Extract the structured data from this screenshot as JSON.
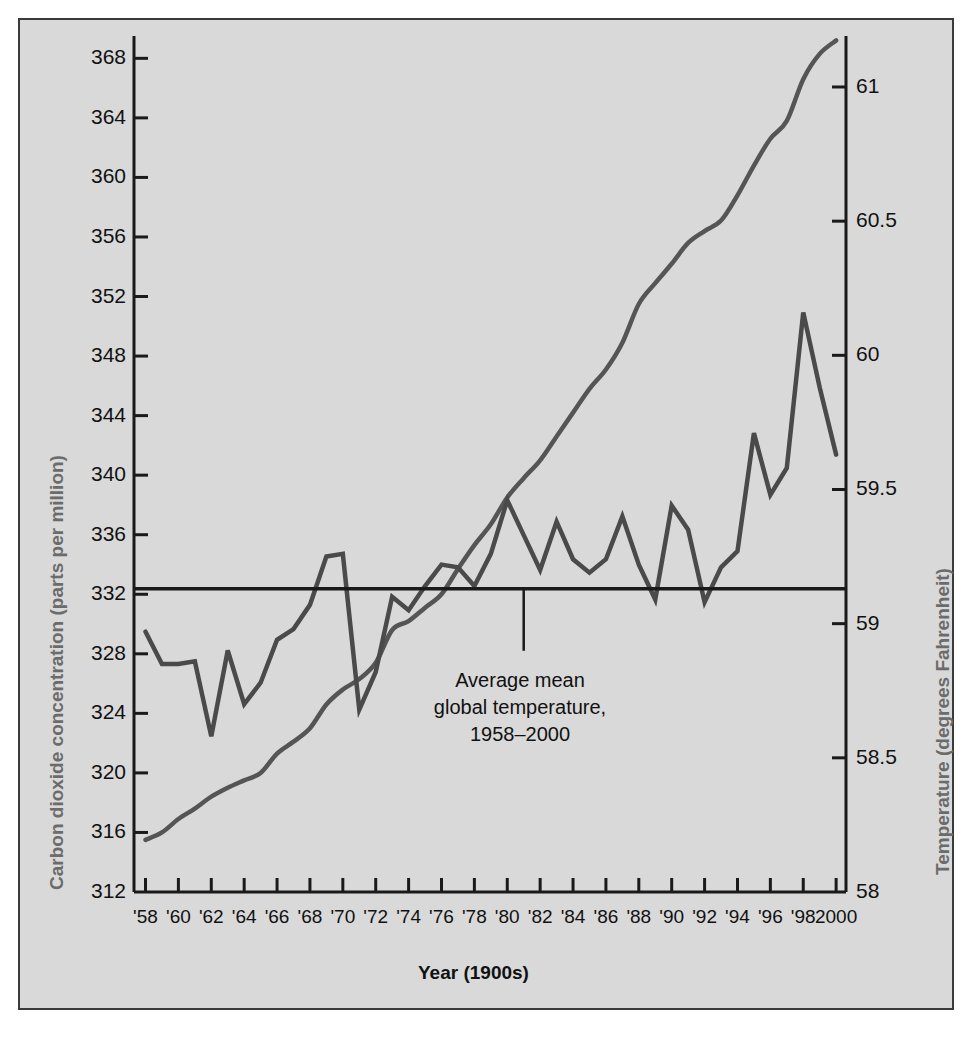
{
  "figure": {
    "background_color": "#d9d9d9",
    "border_color": "#3a3a3a",
    "line_color": "#4a4a4a",
    "axis_color": "#1a1a1a",
    "axis_title_color": "#6b6b6b"
  },
  "axes": {
    "left_title": "Carbon dioxide concentration (parts per million)",
    "right_title": "Temperature (degrees Fahrenheit)",
    "bottom_title": "Year (1900s)",
    "left_ticks": [
      "368",
      "364",
      "360",
      "356",
      "352",
      "348",
      "344",
      "340",
      "336",
      "332",
      "328",
      "324",
      "320",
      "316",
      "312"
    ],
    "right_ticks": [
      "61",
      "60.5",
      "60",
      "59.5",
      "59",
      "58.5",
      "58"
    ],
    "x_ticks": [
      "'58",
      "'60",
      "'62",
      "'64",
      "'66",
      "'68",
      "'70",
      "'72",
      "'74",
      "'76",
      "'78",
      "'80",
      "'82",
      "'84",
      "'86",
      "'88",
      "'90",
      "'92",
      "'94",
      "'96",
      "'98",
      "2000"
    ]
  },
  "annotation": {
    "line1": "Average mean",
    "line2": "global temperature,",
    "line3": "1958–2000",
    "leader_year": 1981,
    "leader_value": 59.13
  },
  "chart_data": {
    "type": "line",
    "title": "",
    "xlabel": "Year (1900s)",
    "ylabel": "Carbon dioxide concentration (parts per million)",
    "y2label": "Temperature (degrees Fahrenheit)",
    "xlim": [
      1957.3,
      2000.6
    ],
    "ylim": [
      312,
      369.5
    ],
    "y2lim": [
      58,
      61.19
    ],
    "grid": false,
    "legend": "none",
    "x": [
      1958,
      1959,
      1960,
      1961,
      1962,
      1963,
      1964,
      1965,
      1966,
      1967,
      1968,
      1969,
      1970,
      1971,
      1972,
      1973,
      1974,
      1975,
      1976,
      1977,
      1978,
      1979,
      1980,
      1981,
      1982,
      1983,
      1984,
      1985,
      1986,
      1987,
      1988,
      1989,
      1990,
      1991,
      1992,
      1993,
      1994,
      1995,
      1996,
      1997,
      1998,
      1999,
      2000
    ],
    "series": [
      {
        "name": "Carbon dioxide concentration",
        "axis": "left",
        "unit": "parts per million",
        "values": [
          315.5,
          316.0,
          316.9,
          317.6,
          318.4,
          319.0,
          319.5,
          320.0,
          321.3,
          322.1,
          323.0,
          324.6,
          325.6,
          326.3,
          327.4,
          329.6,
          330.2,
          331.1,
          332.0,
          333.7,
          335.3,
          336.7,
          338.5,
          339.8,
          341.0,
          342.6,
          344.2,
          345.8,
          347.1,
          348.9,
          351.5,
          352.9,
          354.2,
          355.6,
          356.4,
          357.1,
          358.8,
          360.8,
          362.6,
          363.8,
          366.6,
          368.3,
          369.2
        ]
      },
      {
        "name": "Average global temperature",
        "axis": "right",
        "unit": "degrees Fahrenheit",
        "values": [
          58.97,
          58.85,
          58.85,
          58.86,
          58.58,
          58.9,
          58.7,
          58.78,
          58.94,
          58.98,
          59.07,
          59.25,
          59.26,
          58.68,
          58.82,
          59.1,
          59.05,
          59.14,
          59.22,
          59.21,
          59.14,
          59.26,
          59.46,
          59.33,
          59.2,
          59.38,
          59.24,
          59.19,
          59.24,
          59.4,
          59.22,
          59.09,
          59.44,
          59.35,
          59.08,
          59.21,
          59.27,
          59.71,
          59.48,
          59.58,
          60.16,
          59.88,
          59.63
        ]
      },
      {
        "name": "Average mean global temperature, 1958–2000",
        "axis": "right",
        "type": "reference-line",
        "value": 59.13
      }
    ]
  }
}
